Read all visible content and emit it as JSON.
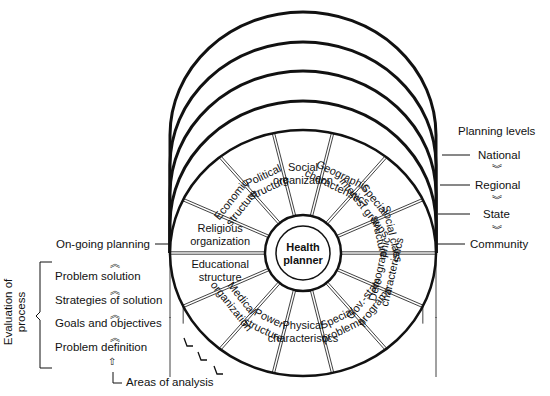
{
  "hub": {
    "line1": "Health",
    "line2": "planner"
  },
  "sectors": [
    {
      "l1": "Religious",
      "l2": "organization"
    },
    {
      "l1": "Economic",
      "l2": "structure"
    },
    {
      "l1": "Political",
      "l2": "structure"
    },
    {
      "l1": "Social",
      "l2": "organization"
    },
    {
      "l1": "Geographic",
      "l2": "characteristics"
    },
    {
      "l1": "Special",
      "l2": "interest groups"
    },
    {
      "l1": "Social class",
      "l2": "structure"
    },
    {
      "l1": "Demographic",
      "l2": "characteristics"
    },
    {
      "l1": "Gov.-state",
      "l2": "programs"
    },
    {
      "l1": "Special",
      "l2": "problems"
    },
    {
      "l1": "Physical",
      "l2": "characteristics"
    },
    {
      "l1": "Power",
      "l2": "structure"
    },
    {
      "l1": "Medical",
      "l2": "organization"
    },
    {
      "l1": "Educational",
      "l2": "structure"
    }
  ],
  "planning_levels": {
    "title": "Planning levels",
    "levels": [
      "National",
      "Regional",
      "State",
      "Community"
    ]
  },
  "process": {
    "ongoing": "On-going planning",
    "evaluation_label_1": "Evaluation of",
    "evaluation_label_2": "process",
    "steps": [
      "Problem solution",
      "Strategies of solution",
      "Goals and objectives",
      "Problem definition"
    ],
    "areas_of_analysis": "Areas of analysis"
  }
}
